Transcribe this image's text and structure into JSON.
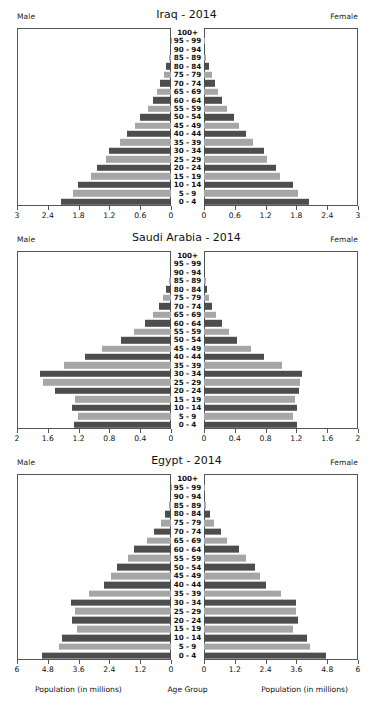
{
  "figure": {
    "male_label": "Male",
    "female_label": "Female",
    "footer_left": "Population (in millions)",
    "footer_center": "Age Group",
    "footer_right": "Population (in millions)",
    "bar_color_dark": "#4d4d4d",
    "bar_color_light": "#a6a6a6",
    "axis_color": "#555555"
  },
  "chart_data": [
    {
      "type": "bar",
      "title": "Iraq - 2014",
      "subtype": "population-pyramid",
      "xlabel": "Population (in millions)",
      "ylabel": "Age Group",
      "legend": [
        "Male",
        "Female"
      ],
      "grid": false,
      "xlim": [
        0,
        3
      ],
      "xticks": [
        0,
        0.6,
        1.2,
        1.8,
        2.4,
        3
      ],
      "xticklabels_left": [
        "3",
        "2.4",
        "1.8",
        "1.2",
        "0.6",
        "0"
      ],
      "xticklabels_right": [
        "0",
        "0.6",
        "1.2",
        "1.8",
        "2.4",
        "3"
      ],
      "categories": [
        "0 - 4",
        "5 - 9",
        "10 - 14",
        "15 - 19",
        "20 - 24",
        "25 - 29",
        "30 - 34",
        "35 - 39",
        "40 - 44",
        "45 - 49",
        "50 - 54",
        "55 - 59",
        "60 - 64",
        "65 - 69",
        "70 - 74",
        "75 - 79",
        "80 - 84",
        "85 - 89",
        "90 - 94",
        "95 - 99",
        "100+"
      ],
      "series": [
        {
          "name": "Male",
          "values": [
            2.15,
            1.93,
            1.82,
            1.57,
            1.46,
            1.28,
            1.22,
            1.0,
            0.86,
            0.71,
            0.6,
            0.46,
            0.36,
            0.27,
            0.21,
            0.14,
            0.09,
            0.04,
            0.02,
            0.01,
            0.0
          ]
        },
        {
          "name": "Female",
          "values": [
            2.06,
            1.85,
            1.75,
            1.5,
            1.41,
            1.23,
            1.18,
            0.96,
            0.83,
            0.69,
            0.58,
            0.45,
            0.35,
            0.27,
            0.21,
            0.15,
            0.09,
            0.04,
            0.02,
            0.01,
            0.0
          ]
        }
      ]
    },
    {
      "type": "bar",
      "title": "Saudi Arabia - 2014",
      "subtype": "population-pyramid",
      "xlabel": "Population (in millions)",
      "ylabel": "Age Group",
      "legend": [
        "Male",
        "Female"
      ],
      "grid": false,
      "xlim": [
        0,
        2
      ],
      "xticks": [
        0,
        0.4,
        0.8,
        1.2,
        1.6,
        2
      ],
      "xticklabels_left": [
        "2",
        "1.6",
        "1.2",
        "0.8",
        "0.4",
        "0"
      ],
      "xticklabels_right": [
        "0",
        "0.4",
        "0.8",
        "1.2",
        "1.6",
        "2"
      ],
      "categories": [
        "0 - 4",
        "5 - 9",
        "10 - 14",
        "15 - 19",
        "20 - 24",
        "25 - 29",
        "30 - 34",
        "35 - 39",
        "40 - 44",
        "45 - 49",
        "50 - 54",
        "55 - 59",
        "60 - 64",
        "65 - 69",
        "70 - 74",
        "75 - 79",
        "80 - 84",
        "85 - 89",
        "90 - 94",
        "95 - 99",
        "100+"
      ],
      "series": [
        {
          "name": "Male",
          "values": [
            1.27,
            1.22,
            1.3,
            1.26,
            1.52,
            1.68,
            1.72,
            1.4,
            1.12,
            0.9,
            0.66,
            0.48,
            0.34,
            0.23,
            0.16,
            0.1,
            0.06,
            0.03,
            0.01,
            0.0,
            0.0
          ]
        },
        {
          "name": "Female",
          "values": [
            1.22,
            1.17,
            1.22,
            1.19,
            1.24,
            1.26,
            1.28,
            1.02,
            0.78,
            0.61,
            0.43,
            0.33,
            0.23,
            0.16,
            0.11,
            0.07,
            0.04,
            0.02,
            0.01,
            0.0,
            0.0
          ]
        }
      ]
    },
    {
      "type": "bar",
      "title": "Egypt - 2014",
      "subtype": "population-pyramid",
      "xlabel": "Population (in millions)",
      "ylabel": "Age Group",
      "legend": [
        "Male",
        "Female"
      ],
      "grid": false,
      "xlim": [
        0,
        6
      ],
      "xticks": [
        0,
        1.2,
        2.4,
        3.6,
        4.8,
        6
      ],
      "xticklabels_left": [
        "6",
        "4.8",
        "3.6",
        "2.4",
        "1.2",
        "0"
      ],
      "xticklabels_right": [
        "0",
        "1.2",
        "2.4",
        "3.6",
        "4.8",
        "6"
      ],
      "categories": [
        "0 - 4",
        "5 - 9",
        "10 - 14",
        "15 - 19",
        "20 - 24",
        "25 - 29",
        "30 - 34",
        "35 - 39",
        "40 - 44",
        "45 - 49",
        "50 - 54",
        "55 - 59",
        "60 - 64",
        "65 - 69",
        "70 - 74",
        "75 - 79",
        "80 - 84",
        "85 - 89",
        "90 - 94",
        "95 - 99",
        "100+"
      ],
      "series": [
        {
          "name": "Male",
          "values": [
            5.06,
            4.38,
            4.28,
            3.68,
            3.88,
            3.78,
            3.92,
            3.22,
            2.64,
            2.34,
            2.12,
            1.7,
            1.44,
            0.96,
            0.68,
            0.38,
            0.24,
            0.09,
            0.03,
            0.01,
            0.0
          ]
        },
        {
          "name": "Female",
          "values": [
            4.8,
            4.16,
            4.06,
            3.5,
            3.68,
            3.6,
            3.62,
            3.02,
            2.44,
            2.2,
            2.02,
            1.64,
            1.38,
            0.92,
            0.66,
            0.38,
            0.24,
            0.09,
            0.03,
            0.01,
            0.0
          ]
        }
      ]
    }
  ]
}
